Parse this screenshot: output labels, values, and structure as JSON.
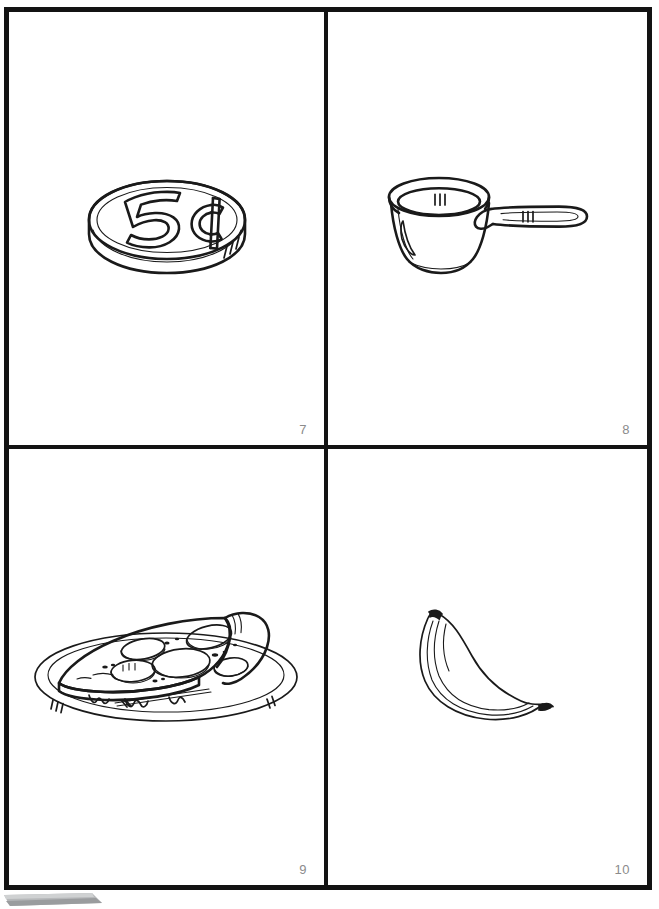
{
  "document": {
    "type": "worksheet-page",
    "layout": "2x2-grid",
    "background_color": "#ffffff",
    "frame_color": "#131313",
    "page_number_color": "#8b8b8b"
  },
  "panels": [
    {
      "id": "panel-7",
      "number": "7",
      "illustration": "nickel-coin",
      "illustration_label": "Nickel coin",
      "coin_text": "5¢",
      "position": "top-left"
    },
    {
      "id": "panel-8",
      "number": "8",
      "illustration": "measuring-cup",
      "illustration_label": "Measuring cup",
      "position": "top-right"
    },
    {
      "id": "panel-9",
      "number": "9",
      "illustration": "pizza-slice",
      "illustration_label": "Pizza slice on plate",
      "position": "bottom-left"
    },
    {
      "id": "panel-10",
      "number": "10",
      "illustration": "banana",
      "illustration_label": "Banana",
      "position": "bottom-right"
    }
  ]
}
